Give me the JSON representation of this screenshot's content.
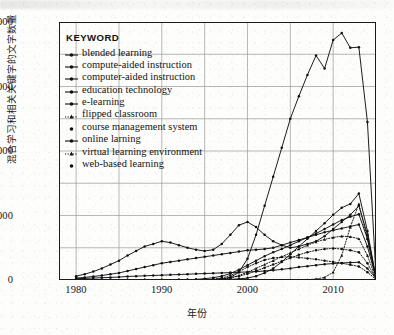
{
  "figure": {
    "legend_title": "KEYWORD",
    "axis": {
      "ylabel": "混合学习和相关关键字的文字数量",
      "xlabel": "年份"
    }
  },
  "chart_data": {
    "type": "line",
    "title": "",
    "xlabel": "年份",
    "ylabel": "混合学习和相关关键字的文字数量",
    "xlim": [
      1978,
      2015
    ],
    "ylim": [
      0,
      4000
    ],
    "xticks": [
      1980,
      1990,
      2000,
      2010
    ],
    "yticks": [
      0,
      1000,
      2000,
      3000,
      4000
    ],
    "y_minor_ticks": [
      500,
      1500,
      2500,
      3500
    ],
    "x_minor_ticks": [
      1985,
      1995,
      2005
    ],
    "grid": true,
    "legend_position": "upper-left-inside",
    "x": [
      1980,
      1981,
      1982,
      1983,
      1984,
      1985,
      1986,
      1987,
      1988,
      1989,
      1990,
      1991,
      1992,
      1993,
      1994,
      1995,
      1996,
      1997,
      1998,
      1999,
      2000,
      2001,
      2002,
      2003,
      2004,
      2005,
      2006,
      2007,
      2008,
      2009,
      2010,
      2011,
      2012,
      2013,
      2014,
      2015
    ],
    "series": [
      {
        "name": "blended learning",
        "marker": "dot",
        "linestyle": "solid",
        "color": "#111111",
        "values": [
          0,
          0,
          0,
          0,
          0,
          0,
          0,
          0,
          0,
          0,
          0,
          0,
          0,
          0,
          0,
          0,
          0,
          5,
          10,
          18,
          30,
          60,
          110,
          180,
          280,
          400,
          520,
          640,
          760,
          880,
          1010,
          1120,
          1180,
          1340,
          760,
          30
        ]
      },
      {
        "name": "compute-aided instruction",
        "marker": "dot",
        "linestyle": "solid",
        "color": "#111111",
        "values": [
          20,
          25,
          30,
          35,
          40,
          45,
          55,
          60,
          65,
          70,
          75,
          80,
          85,
          90,
          95,
          100,
          105,
          110,
          115,
          120,
          125,
          130,
          140,
          150,
          165,
          180,
          200,
          215,
          230,
          245,
          255,
          265,
          270,
          275,
          180,
          25
        ]
      },
      {
        "name": "computer-aided instruction",
        "marker": "dot",
        "linestyle": "solid",
        "color": "#111111",
        "values": [
          60,
          90,
          130,
          180,
          240,
          300,
          380,
          450,
          520,
          560,
          600,
          580,
          540,
          500,
          470,
          450,
          470,
          560,
          700,
          850,
          900,
          820,
          700,
          600,
          540,
          500,
          520,
          560,
          600,
          680,
          790,
          900,
          1010,
          1150,
          700,
          40
        ]
      },
      {
        "name": "education technology",
        "marker": "dot",
        "linestyle": "solid",
        "color": "#111111",
        "values": [
          30,
          40,
          55,
          70,
          90,
          110,
          140,
          170,
          200,
          230,
          260,
          280,
          300,
          320,
          340,
          360,
          380,
          400,
          420,
          440,
          460,
          470,
          480,
          500,
          540,
          580,
          620,
          660,
          700,
          740,
          770,
          800,
          830,
          860,
          520,
          30
        ]
      },
      {
        "name": "e-learning",
        "marker": "dot",
        "linestyle": "solid",
        "color": "#111111",
        "values": [
          0,
          0,
          0,
          0,
          0,
          0,
          0,
          0,
          0,
          0,
          0,
          0,
          0,
          0,
          0,
          0,
          5,
          15,
          40,
          120,
          330,
          700,
          1150,
          1600,
          2050,
          2500,
          2850,
          3180,
          3480,
          3280,
          3720,
          3830,
          3600,
          3610,
          2450,
          60
        ]
      },
      {
        "name": "flipped classroom",
        "marker": "triangle",
        "linestyle": "dotted",
        "color": "#111111",
        "values": [
          0,
          0,
          0,
          0,
          0,
          0,
          0,
          0,
          0,
          0,
          0,
          0,
          0,
          0,
          0,
          0,
          0,
          0,
          0,
          0,
          0,
          0,
          0,
          0,
          0,
          0,
          0,
          5,
          15,
          40,
          120,
          380,
          820,
          1180,
          640,
          20
        ]
      },
      {
        "name": "course management system",
        "marker": "dot",
        "linestyle": "dotted",
        "color": "#111111",
        "values": [
          0,
          0,
          0,
          0,
          0,
          0,
          0,
          0,
          0,
          0,
          0,
          0,
          0,
          0,
          0,
          5,
          10,
          20,
          35,
          60,
          95,
          140,
          190,
          240,
          290,
          340,
          390,
          430,
          460,
          480,
          490,
          480,
          460,
          430,
          260,
          15
        ]
      },
      {
        "name": "online larning",
        "marker": "dot",
        "linestyle": "solid",
        "color": "#111111",
        "values": [
          0,
          0,
          0,
          0,
          0,
          0,
          0,
          0,
          0,
          0,
          0,
          0,
          0,
          5,
          10,
          20,
          35,
          60,
          100,
          160,
          230,
          300,
          370,
          430,
          480,
          540,
          600,
          660,
          720,
          790,
          860,
          930,
          980,
          1020,
          640,
          35
        ]
      },
      {
        "name": "virtual learning environment",
        "marker": "triangle",
        "linestyle": "dotted",
        "color": "#111111",
        "values": [
          0,
          0,
          0,
          0,
          0,
          0,
          0,
          0,
          0,
          0,
          0,
          0,
          0,
          0,
          0,
          0,
          5,
          15,
          35,
          70,
          120,
          180,
          240,
          300,
          360,
          420,
          480,
          540,
          590,
          630,
          660,
          680,
          670,
          640,
          380,
          20
        ]
      },
      {
        "name": "web-based learning",
        "marker": "dot",
        "linestyle": "dotted",
        "color": "#111111",
        "values": [
          0,
          0,
          0,
          0,
          0,
          0,
          0,
          0,
          0,
          0,
          0,
          0,
          0,
          0,
          0,
          0,
          10,
          30,
          70,
          130,
          200,
          260,
          310,
          340,
          355,
          360,
          350,
          335,
          320,
          300,
          280,
          260,
          235,
          210,
          120,
          10
        ]
      }
    ]
  }
}
